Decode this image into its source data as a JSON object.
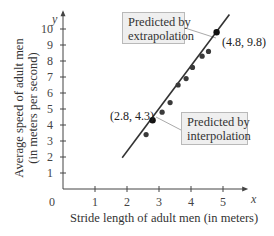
{
  "chart_data": {
    "type": "scatter",
    "title": "",
    "xlabel": "Stride length of adult men (in meters)",
    "ylabel": "Average speed of adult men (in meters per second)",
    "ylabel_lines": [
      "Average speed of adult men",
      "(in meters per second)"
    ],
    "x_axis_var": "x",
    "y_axis_var": "y",
    "xlim": [
      0,
      5.6
    ],
    "ylim": [
      0,
      10.8
    ],
    "x_ticks": [
      1,
      2,
      3,
      4,
      5
    ],
    "y_ticks": [
      1,
      2,
      3,
      4,
      5,
      6,
      7,
      8,
      9,
      10
    ],
    "origin_label": "0",
    "grid": false,
    "series": [
      {
        "name": "Observed data",
        "type": "scatter",
        "points": [
          [
            2.55,
            3.4
          ],
          [
            3.05,
            4.8
          ],
          [
            3.3,
            5.4
          ],
          [
            3.55,
            6.5
          ],
          [
            3.8,
            6.9
          ],
          [
            4.0,
            7.6
          ],
          [
            4.3,
            8.3
          ],
          [
            4.5,
            8.6
          ]
        ]
      },
      {
        "name": "Line of best fit",
        "type": "line",
        "points": [
          [
            1.85,
            1.95
          ],
          [
            5.2,
            10.9
          ]
        ]
      },
      {
        "name": "Predicted points",
        "type": "scatter",
        "points": [
          {
            "x": 2.8,
            "y": 4.3,
            "label": "(2.8, 4.3)",
            "note": "Predicted by interpolation"
          },
          {
            "x": 4.8,
            "y": 9.8,
            "label": "(4.8, 9.8)",
            "note": "Predicted by extrapolation"
          }
        ]
      }
    ],
    "annotations": [
      {
        "text_lines": [
          "Predicted by",
          "extrapolation"
        ],
        "points_to": [
          4.8,
          9.8
        ]
      },
      {
        "text_lines": [
          "Predicted by",
          "interpolation"
        ],
        "points_to": [
          2.8,
          4.3
        ]
      }
    ]
  },
  "labels": {
    "x_title": "Stride length of adult men (in meters)",
    "y_title_1": "Average speed of adult men",
    "y_title_2": "(in meters per second)",
    "x_var": "x",
    "y_var": "y",
    "origin": "0",
    "extrap_line1": "Predicted by",
    "extrap_line2": "extrapolation",
    "interp_line1": "Predicted by",
    "interp_line2": "interpolation",
    "pt_extrap": "(4.8, 9.8)",
    "pt_interp": "(2.8, 4.3)"
  }
}
